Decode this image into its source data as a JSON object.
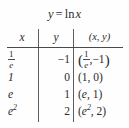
{
  "figure": {
    "title": {
      "lhs": "y",
      "equals": "=",
      "fn": "ln",
      "arg": "x",
      "full": "y = ln x"
    },
    "table": {
      "columns": [
        {
          "key": "x",
          "label": "x"
        },
        {
          "key": "y",
          "label": "y"
        },
        {
          "key": "xy",
          "label": "(x, y)"
        }
      ],
      "rows": [
        {
          "x_num": "1",
          "x_den": "e",
          "x_text": "1/e",
          "y": "−1",
          "pair_open": "(",
          "pair_num": "1",
          "pair_den": "e",
          "pair_sep": ",",
          "pair_y": "−1",
          "pair_close": ")",
          "pair_text": "(1/e, −1)"
        },
        {
          "x_text": "1",
          "y": "0",
          "pair_text": "(1, 0)"
        },
        {
          "x_text": "e",
          "y": "1",
          "pair_text": "(e, 1)"
        },
        {
          "x_base": "e",
          "x_exp": "2",
          "x_text": "e²",
          "y": "2",
          "pair_open": "(",
          "pair_base": "e",
          "pair_exp": "2",
          "pair_sep": ",",
          "pair_y": "2",
          "pair_close": ")",
          "pair_text": "(e², 2)"
        }
      ]
    },
    "colors": {
      "background": "#fefefe",
      "text": "#2b2b2b",
      "rule": "#4a4a4a",
      "vertical_rule": "#5d5d5d"
    }
  }
}
